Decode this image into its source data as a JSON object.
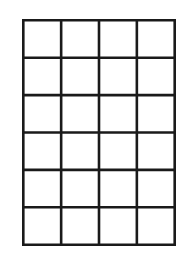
{
  "diagram": {
    "type": "grid",
    "columns": 4,
    "rows": 6,
    "line_color": "#1a1a1a",
    "background": "#ffffff",
    "cells": []
  }
}
